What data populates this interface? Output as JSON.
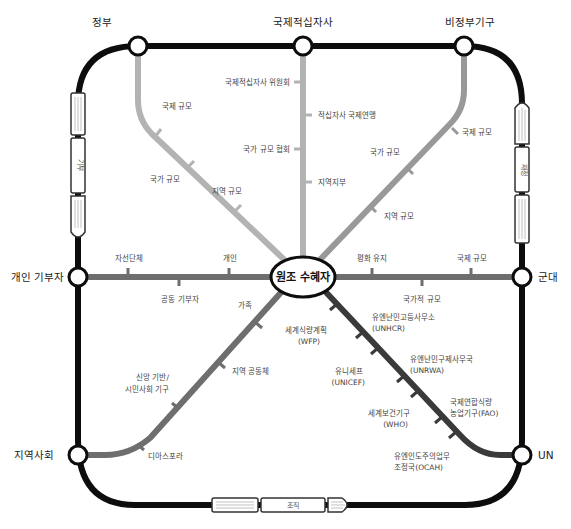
{
  "diagram": {
    "type": "metro-map",
    "hub": {
      "label": "원조 수혜자"
    },
    "ring_stations": {
      "top_left": "정부",
      "top_center": "국제적십자사",
      "top_right": "비정부기구",
      "left": "개인 기부자",
      "right": "군대",
      "bottom_left": "지역사회",
      "bottom_right": "UN"
    },
    "trains": {
      "left": "기부",
      "right": "재정",
      "bottom": "조직"
    },
    "lines": {
      "government": {
        "color": "#b3b3b3",
        "stops": [
          "국제 규모",
          "국가 규모",
          "지역 규모"
        ]
      },
      "red_cross": {
        "color": "#b3b3b3",
        "stops": [
          "국제적십자사 위원회",
          "적십자사 국제연맹",
          "국가 규모 협회",
          "지역지부"
        ]
      },
      "ngo": {
        "color": "#999999",
        "stops": [
          "국제 규모",
          "국가 규모",
          "지역 규모"
        ]
      },
      "individual_donor": {
        "color": "#6e6e6e",
        "stops": [
          "자선단체",
          "공동 기부자",
          "개인"
        ]
      },
      "military": {
        "color": "#6e6e6e",
        "stops": [
          "평화 유지",
          "국가적 규모",
          "국제 규모"
        ]
      },
      "community": {
        "color": "#6e6e6e",
        "stops": [
          "가족",
          "지역 공동체",
          "신앙 기반/",
          "시민사회 기구",
          "디아스포라"
        ]
      },
      "un": {
        "color": "#3a3a3a",
        "stops": [
          {
            "name": "세계식량계획",
            "abbr": "(WFP)"
          },
          {
            "name": "유엔난민고등사무소",
            "abbr": "(UNHCR)"
          },
          {
            "name": "유니세프",
            "abbr": "(UNICEF)"
          },
          {
            "name": "유엔난민구제사무국",
            "abbr": "(UNRWA)"
          },
          {
            "name": "세계보건기구",
            "abbr": "(WHO)"
          },
          {
            "name": "국제연합식량",
            "abbr": "농업기구(FAO)"
          },
          {
            "name": "유엔인도주의업무",
            "abbr": "조정국(OCAH)"
          }
        ]
      }
    },
    "colors": {
      "ring": "#0d0d0d",
      "light_line": "#b3b3b3",
      "mid_line": "#999999",
      "dark_line": "#6e6e6e",
      "un_line": "#3a3a3a"
    }
  }
}
